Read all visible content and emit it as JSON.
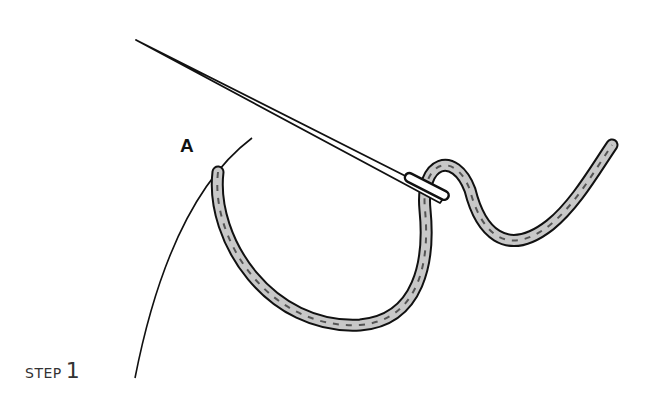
{
  "diagram": {
    "point_label": "A",
    "step": {
      "word": "STEP",
      "number": "1"
    },
    "elements": [
      "needle",
      "thread",
      "fabric-edge-curve"
    ],
    "colors": {
      "ink": "#111111",
      "thread_fill": "#bdbdbd",
      "background": "#ffffff"
    }
  }
}
